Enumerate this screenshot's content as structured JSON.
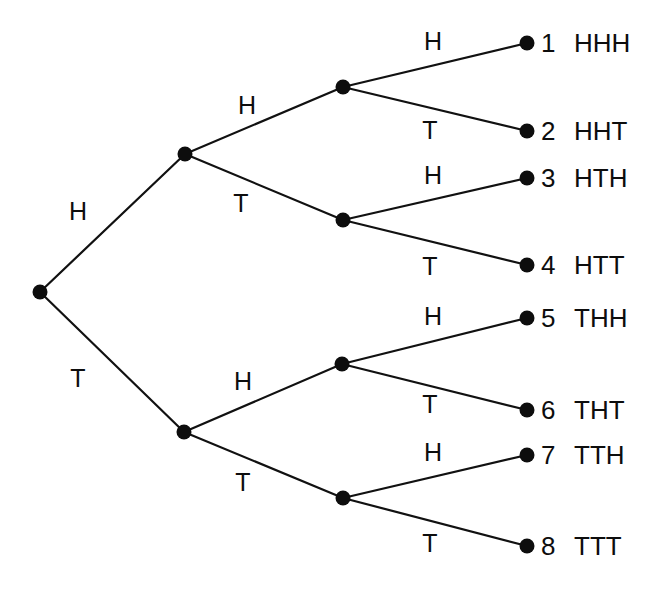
{
  "figure": {
    "kind": "probability-tree-diagram",
    "width": 659,
    "height": 593,
    "background_color": "#ffffff",
    "line_color": "#111111",
    "node_color": "#0d0d0d",
    "text_color": "#0d0d0d",
    "line_width": 2.2,
    "node_radius": 7.5
  },
  "labels": {
    "heads": "H",
    "tails": "T"
  },
  "nodes": [
    {
      "id": "root",
      "name": "root-node",
      "x": 40,
      "y": 292
    },
    {
      "id": "H",
      "name": "node-h",
      "x": 185,
      "y": 154
    },
    {
      "id": "T",
      "name": "node-t",
      "x": 184,
      "y": 432
    },
    {
      "id": "HH",
      "name": "node-hh",
      "x": 343,
      "y": 87
    },
    {
      "id": "HT",
      "name": "node-ht",
      "x": 343,
      "y": 220
    },
    {
      "id": "TH",
      "name": "node-th",
      "x": 342,
      "y": 364
    },
    {
      "id": "TT",
      "name": "node-tt",
      "x": 343,
      "y": 498
    }
  ],
  "leaves": [
    {
      "index": "1",
      "outcome": "HHH",
      "x": 527,
      "y": 43,
      "parent": "HH",
      "branch": "H"
    },
    {
      "index": "2",
      "outcome": "HHT",
      "x": 527,
      "y": 131,
      "parent": "HH",
      "branch": "T"
    },
    {
      "index": "3",
      "outcome": "HTH",
      "x": 527,
      "y": 178,
      "parent": "HT",
      "branch": "H"
    },
    {
      "index": "4",
      "outcome": "HTT",
      "x": 527,
      "y": 265,
      "parent": "HT",
      "branch": "T"
    },
    {
      "index": "5",
      "outcome": "THH",
      "x": 527,
      "y": 318,
      "parent": "TH",
      "branch": "H"
    },
    {
      "index": "6",
      "outcome": "THT",
      "x": 527,
      "y": 410,
      "parent": "TH",
      "branch": "T"
    },
    {
      "index": "7",
      "outcome": "TTH",
      "x": 527,
      "y": 455,
      "parent": "TT",
      "branch": "H"
    },
    {
      "index": "8",
      "outcome": "TTT",
      "x": 527,
      "y": 546,
      "parent": "TT",
      "branch": "T"
    }
  ],
  "edges": [
    {
      "name": "edge-root-h",
      "from": "root",
      "to": "H",
      "label": "H",
      "label_x": 78,
      "label_y": 211
    },
    {
      "name": "edge-root-t",
      "from": "root",
      "to": "T",
      "label": "T",
      "label_x": 78,
      "label_y": 378
    },
    {
      "name": "edge-h-hh",
      "from": "H",
      "to": "HH",
      "label": "H",
      "label_x": 247,
      "label_y": 105
    },
    {
      "name": "edge-h-ht",
      "from": "H",
      "to": "HT",
      "label": "T",
      "label_x": 241,
      "label_y": 203
    },
    {
      "name": "edge-t-th",
      "from": "T",
      "to": "TH",
      "label": "H",
      "label_x": 243,
      "label_y": 381
    },
    {
      "name": "edge-t-tt",
      "from": "T",
      "to": "TT",
      "label": "T",
      "label_x": 243,
      "label_y": 482
    },
    {
      "name": "edge-hh-1",
      "from": "HH",
      "to": "1",
      "label": "H",
      "label_x": 433,
      "label_y": 41
    },
    {
      "name": "edge-hh-2",
      "from": "HH",
      "to": "2",
      "label": "T",
      "label_x": 430,
      "label_y": 130
    },
    {
      "name": "edge-ht-3",
      "from": "HT",
      "to": "3",
      "label": "H",
      "label_x": 433,
      "label_y": 175
    },
    {
      "name": "edge-ht-4",
      "from": "HT",
      "to": "4",
      "label": "T",
      "label_x": 430,
      "label_y": 266
    },
    {
      "name": "edge-th-5",
      "from": "TH",
      "to": "5",
      "label": "H",
      "label_x": 433,
      "label_y": 316
    },
    {
      "name": "edge-th-6",
      "from": "TH",
      "to": "6",
      "label": "T",
      "label_x": 430,
      "label_y": 404
    },
    {
      "name": "edge-tt-7",
      "from": "TT",
      "to": "7",
      "label": "H",
      "label_x": 433,
      "label_y": 452
    },
    {
      "name": "edge-tt-8",
      "from": "TT",
      "to": "8",
      "label": "T",
      "label_x": 430,
      "label_y": 543
    }
  ],
  "leaf_text_layout": {
    "index_x": 541,
    "outcome_x": 574
  }
}
